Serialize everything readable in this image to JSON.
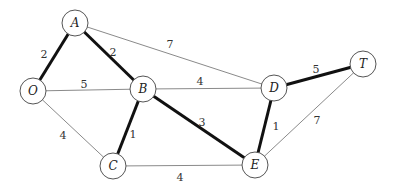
{
  "graph": {
    "type": "weighted-undirected-graph",
    "nodes": [
      {
        "id": "A",
        "label": "A",
        "x": 75,
        "y": 23
      },
      {
        "id": "O",
        "label": "O",
        "x": 33,
        "y": 91
      },
      {
        "id": "B",
        "label": "B",
        "x": 143,
        "y": 89
      },
      {
        "id": "C",
        "label": "C",
        "x": 113,
        "y": 166
      },
      {
        "id": "D",
        "label": "D",
        "x": 274,
        "y": 88
      },
      {
        "id": "E",
        "label": "E",
        "x": 255,
        "y": 165
      },
      {
        "id": "T",
        "label": "T",
        "x": 363,
        "y": 64
      }
    ],
    "edges": [
      {
        "from": "O",
        "to": "A",
        "weight": "2",
        "bold": true,
        "lx": 44,
        "ly": 54
      },
      {
        "from": "A",
        "to": "B",
        "weight": "2",
        "bold": true,
        "lx": 113,
        "ly": 52
      },
      {
        "from": "A",
        "to": "D",
        "weight": "7",
        "bold": false,
        "lx": 170,
        "ly": 44
      },
      {
        "from": "O",
        "to": "B",
        "weight": "5",
        "bold": false,
        "lx": 84,
        "ly": 84
      },
      {
        "from": "O",
        "to": "C",
        "weight": "4",
        "bold": false,
        "lx": 63,
        "ly": 135
      },
      {
        "from": "B",
        "to": "C",
        "weight": "1",
        "bold": true,
        "lx": 133,
        "ly": 134
      },
      {
        "from": "B",
        "to": "D",
        "weight": "4",
        "bold": false,
        "lx": 200,
        "ly": 81
      },
      {
        "from": "B",
        "to": "E",
        "weight": "3",
        "bold": true,
        "lx": 202,
        "ly": 122
      },
      {
        "from": "C",
        "to": "E",
        "weight": "4",
        "bold": false,
        "lx": 180,
        "ly": 177
      },
      {
        "from": "D",
        "to": "E",
        "weight": "1",
        "bold": true,
        "lx": 276,
        "ly": 126
      },
      {
        "from": "D",
        "to": "T",
        "weight": "5",
        "bold": true,
        "lx": 316,
        "ly": 69
      },
      {
        "from": "E",
        "to": "T",
        "weight": "7",
        "bold": false,
        "lx": 317,
        "ly": 120
      }
    ],
    "node_radius": 13,
    "colors": {
      "edge": "#8a8a8a",
      "bold_edge": "#111111",
      "node_stroke": "#555555",
      "background": "#ffffff"
    }
  }
}
